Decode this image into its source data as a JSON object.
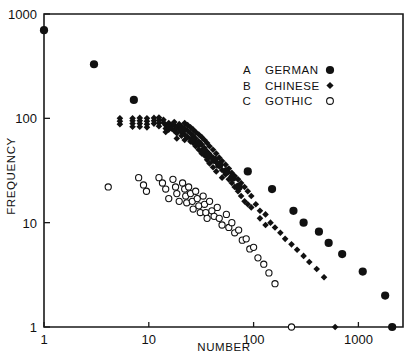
{
  "chart_data": {
    "type": "scatter",
    "title": "",
    "xlabel": "NUMBER",
    "ylabel": "FREQUENCY",
    "xscale": "log",
    "yscale": "log",
    "xlim": [
      1,
      3000
    ],
    "ylim": [
      1,
      1000
    ],
    "xticks": [
      1,
      10,
      100,
      1000
    ],
    "xticklabels": [
      "1",
      "10",
      "100",
      "1000"
    ],
    "yticks": [
      1,
      10,
      100,
      1000
    ],
    "yticklabels": [
      "1",
      "10",
      "100",
      "1000"
    ],
    "grid": false,
    "legend_position": "upper-right-inside",
    "legend": [
      {
        "key": "A",
        "name": "GERMAN",
        "marker": "filled-circle"
      },
      {
        "key": "B",
        "name": "CHINESE",
        "marker": "filled-diamond"
      },
      {
        "key": "C",
        "name": "GOTHIC",
        "marker": "open-circle"
      }
    ],
    "series": [
      {
        "name": "GERMAN",
        "key": "A",
        "marker": "filled-circle",
        "color": "#111111",
        "points": [
          [
            1,
            700
          ],
          [
            3,
            330
          ],
          [
            7.2,
            150
          ],
          [
            21,
            78
          ],
          [
            26,
            62
          ],
          [
            30,
            57
          ],
          [
            33,
            48
          ],
          [
            37,
            44
          ],
          [
            42,
            40
          ],
          [
            47,
            36
          ],
          [
            55,
            31
          ],
          [
            63,
            27
          ],
          [
            72,
            22
          ],
          [
            88,
            31
          ],
          [
            150,
            21
          ],
          [
            240,
            13
          ],
          [
            300,
            10
          ],
          [
            420,
            8.2
          ],
          [
            520,
            6.4
          ],
          [
            700,
            5.0
          ],
          [
            1100,
            3.4
          ],
          [
            1800,
            2.0
          ],
          [
            2100,
            1.0
          ]
        ]
      },
      {
        "name": "CHINESE",
        "key": "B",
        "marker": "filled-diamond",
        "color": "#111111",
        "points": [
          [
            5.3,
            100
          ],
          [
            5.3,
            94
          ],
          [
            5.3,
            88
          ],
          [
            7.0,
            100
          ],
          [
            7.0,
            95
          ],
          [
            7.0,
            89
          ],
          [
            7.0,
            83
          ],
          [
            8.2,
            101
          ],
          [
            8.2,
            95
          ],
          [
            8.2,
            89
          ],
          [
            8.2,
            83
          ],
          [
            9.6,
            100
          ],
          [
            9.6,
            94
          ],
          [
            9.6,
            88
          ],
          [
            9.6,
            82
          ],
          [
            11.2,
            101
          ],
          [
            11.2,
            95
          ],
          [
            11.2,
            89
          ],
          [
            12.5,
            102
          ],
          [
            12.5,
            96
          ],
          [
            12.5,
            90
          ],
          [
            12.5,
            84
          ],
          [
            13.8,
            97
          ],
          [
            13.8,
            91
          ],
          [
            14.5,
            86
          ],
          [
            14.5,
            80
          ],
          [
            14.5,
            74
          ],
          [
            15.5,
            90
          ],
          [
            15.5,
            84
          ],
          [
            15.5,
            78
          ],
          [
            16.5,
            86
          ],
          [
            16.5,
            80
          ],
          [
            17.5,
            92
          ],
          [
            17.5,
            86
          ],
          [
            17.5,
            76
          ],
          [
            18.5,
            82
          ],
          [
            18.5,
            72
          ],
          [
            18.5,
            64
          ],
          [
            19.5,
            88
          ],
          [
            19.5,
            78
          ],
          [
            20.5,
            84
          ],
          [
            20.5,
            74
          ],
          [
            20.5,
            68
          ],
          [
            22,
            90
          ],
          [
            22,
            80
          ],
          [
            22,
            70
          ],
          [
            22,
            62
          ],
          [
            23.5,
            86
          ],
          [
            23.5,
            76
          ],
          [
            23.5,
            66
          ],
          [
            25,
            82
          ],
          [
            25,
            72
          ],
          [
            25,
            60
          ],
          [
            26.5,
            78
          ],
          [
            26.5,
            68
          ],
          [
            26.5,
            58
          ],
          [
            28,
            74
          ],
          [
            28,
            64
          ],
          [
            28,
            54
          ],
          [
            30,
            70
          ],
          [
            30,
            60
          ],
          [
            30,
            50
          ],
          [
            32,
            66
          ],
          [
            32,
            56
          ],
          [
            32,
            46
          ],
          [
            34,
            62
          ],
          [
            34,
            52
          ],
          [
            34,
            44
          ],
          [
            36,
            58
          ],
          [
            36,
            48
          ],
          [
            36,
            40
          ],
          [
            38,
            54
          ],
          [
            38,
            45
          ],
          [
            38,
            37
          ],
          [
            41,
            50
          ],
          [
            41,
            42
          ],
          [
            41,
            34
          ],
          [
            44,
            46
          ],
          [
            44,
            38
          ],
          [
            44,
            31
          ],
          [
            47,
            42
          ],
          [
            47,
            35
          ],
          [
            50,
            39
          ],
          [
            50,
            32
          ],
          [
            50,
            27
          ],
          [
            54,
            36
          ],
          [
            54,
            29
          ],
          [
            58,
            33
          ],
          [
            58,
            26
          ],
          [
            62,
            30
          ],
          [
            62,
            24
          ],
          [
            66,
            28
          ],
          [
            66,
            22
          ],
          [
            71,
            26
          ],
          [
            71,
            20
          ],
          [
            76,
            24
          ],
          [
            76,
            18
          ],
          [
            82,
            22
          ],
          [
            82,
            16
          ],
          [
            88,
            20
          ],
          [
            88,
            15
          ],
          [
            95,
            18
          ],
          [
            95,
            14
          ],
          [
            105,
            15
          ],
          [
            115,
            13
          ],
          [
            115,
            11
          ],
          [
            130,
            12
          ],
          [
            130,
            9.5
          ],
          [
            145,
            10
          ],
          [
            160,
            9.0
          ],
          [
            180,
            8.0
          ],
          [
            200,
            7.0
          ],
          [
            230,
            6.2
          ],
          [
            260,
            5.5
          ],
          [
            300,
            4.8
          ],
          [
            340,
            4.2
          ],
          [
            400,
            3.6
          ],
          [
            470,
            3.0
          ],
          [
            600,
            1.0
          ]
        ]
      },
      {
        "name": "GOTHIC",
        "key": "C",
        "marker": "open-circle",
        "color": "#111111",
        "points": [
          [
            4.1,
            22
          ],
          [
            8.0,
            27
          ],
          [
            8.9,
            23
          ],
          [
            9.5,
            20
          ],
          [
            12.5,
            27
          ],
          [
            13.5,
            24
          ],
          [
            14.5,
            21
          ],
          [
            15.5,
            17
          ],
          [
            17.0,
            26
          ],
          [
            18.0,
            22
          ],
          [
            18.5,
            19
          ],
          [
            19.5,
            16
          ],
          [
            21,
            24
          ],
          [
            22,
            21
          ],
          [
            22.5,
            18
          ],
          [
            23,
            15.5
          ],
          [
            24,
            22
          ],
          [
            25,
            19
          ],
          [
            26,
            16
          ],
          [
            26.5,
            13.5
          ],
          [
            28,
            20
          ],
          [
            29,
            17
          ],
          [
            30,
            14.5
          ],
          [
            31,
            12.5
          ],
          [
            33,
            18
          ],
          [
            34,
            15
          ],
          [
            35,
            12.5
          ],
          [
            36,
            11
          ],
          [
            38,
            16
          ],
          [
            40,
            13
          ],
          [
            42,
            11.5
          ],
          [
            45,
            14
          ],
          [
            47,
            11
          ],
          [
            50,
            9.5
          ],
          [
            55,
            12
          ],
          [
            58,
            9.0
          ],
          [
            62,
            10
          ],
          [
            66,
            8.0
          ],
          [
            72,
            8.5
          ],
          [
            78,
            6.8
          ],
          [
            85,
            7.0
          ],
          [
            92,
            5.6
          ],
          [
            100,
            5.8
          ],
          [
            110,
            4.6
          ],
          [
            125,
            4.0
          ],
          [
            140,
            3.3
          ],
          [
            160,
            2.6
          ],
          [
            230,
            1.0
          ]
        ]
      }
    ]
  },
  "axes": {
    "xlabel": "NUMBER",
    "ylabel": "FREQUENCY",
    "x_tick_labels": [
      "1",
      "10",
      "100",
      "1000"
    ],
    "y_tick_labels": [
      "1",
      "10",
      "100",
      "1000"
    ]
  }
}
